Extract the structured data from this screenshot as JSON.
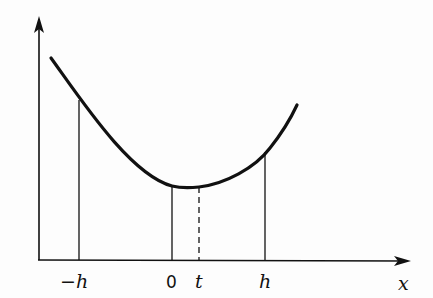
{
  "diagram": {
    "type": "function-plot",
    "axes": {
      "x_label": "x",
      "y_label": ""
    },
    "tick_labels": {
      "neg_h": "−h",
      "zero": "0",
      "t": "t",
      "h": "h"
    },
    "ordinates": [
      {
        "at": "-h",
        "style": "solid"
      },
      {
        "at": "0",
        "style": "solid"
      },
      {
        "at": "t",
        "style": "dashed"
      },
      {
        "at": "h",
        "style": "solid"
      }
    ],
    "colors": {
      "ink": "#111111",
      "background": "#fdfdfd"
    }
  }
}
